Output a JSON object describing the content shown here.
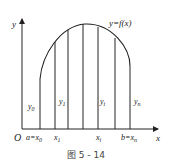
{
  "diagram": {
    "curve_label": "y=f(x)",
    "axis_x_label": "x",
    "axis_y_label": "y",
    "origin_label": "O",
    "x_ticks": [
      {
        "label": "a=x",
        "sub": "0"
      },
      {
        "label": "x",
        "sub": "1"
      },
      {
        "label": "x",
        "sub": "i"
      },
      {
        "label": "b=x",
        "sub": "n"
      }
    ],
    "ordinates": [
      {
        "label": "y",
        "sub": "0"
      },
      {
        "label": "y",
        "sub": "1"
      },
      {
        "label": "y",
        "sub": "i"
      },
      {
        "label": "y",
        "sub": "n"
      }
    ],
    "caption": "图 5 - 14",
    "colors": {
      "stroke": "#222222",
      "background": "#ffffff"
    }
  }
}
